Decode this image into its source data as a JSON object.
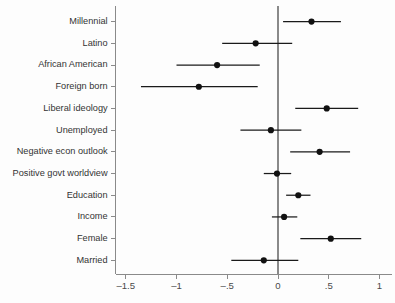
{
  "chart_data": {
    "type": "scatter",
    "title": "",
    "subtitle": "",
    "xlabel": "",
    "ylabel": "",
    "xlim": [
      -1.6,
      1.12
    ],
    "grid": false,
    "legend": null,
    "reference_line": 0,
    "xticks": [
      -1.5,
      -1,
      -0.5,
      0,
      0.5,
      1
    ],
    "xticklabels": [
      "–1.5",
      "–1",
      "–.5",
      "0",
      ".5",
      "1"
    ],
    "categories": [
      "Millennial",
      "Latino",
      "African American",
      "Foreign born",
      "Liberal ideology",
      "Unemployed",
      "Negative econ outlook",
      "Positive govt worldview",
      "Education",
      "Income",
      "Female",
      "Married"
    ],
    "values": [
      0.33,
      -0.22,
      -0.6,
      -0.78,
      0.48,
      -0.07,
      0.41,
      -0.01,
      0.2,
      0.06,
      0.52,
      -0.14
    ],
    "ci_low": [
      0.05,
      -0.55,
      -1.0,
      -1.35,
      0.17,
      -0.37,
      0.12,
      -0.14,
      0.08,
      -0.06,
      0.22,
      -0.46
    ],
    "ci_high": [
      0.62,
      0.14,
      -0.18,
      -0.2,
      0.79,
      0.23,
      0.71,
      0.13,
      0.32,
      0.19,
      0.82,
      0.2
    ],
    "point_color": "#111111",
    "line_color": "#1a1a1a",
    "axis_color": "#8a8a8a"
  }
}
